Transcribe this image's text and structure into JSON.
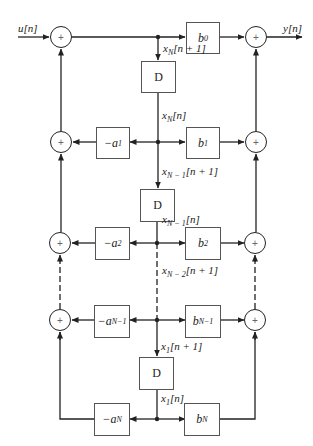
{
  "diagram": {
    "type": "signal-flow block diagram (direct form II transposed / state-space)",
    "input_label": "u[n]",
    "output_label": "y[n]",
    "adder_symbol": "+",
    "delay_label": "D",
    "feedforward_gains": [
      {
        "base": "b",
        "sub": "0"
      },
      {
        "base": "b",
        "sub": "1"
      },
      {
        "base": "b",
        "sub": "2"
      },
      {
        "base": "b",
        "sub": "N−1"
      },
      {
        "base": "b",
        "sub": "N"
      }
    ],
    "feedback_gains": [
      {
        "prefix": "−",
        "base": "a",
        "sub": "1"
      },
      {
        "prefix": "−",
        "base": "a",
        "sub": "2"
      },
      {
        "prefix": "−",
        "base": "a",
        "sub": "N−1"
      },
      {
        "prefix": "−",
        "base": "a",
        "sub": "N"
      }
    ],
    "state_labels": [
      {
        "base": "x",
        "sub": "N",
        "arg": "[n + 1]"
      },
      {
        "base": "x",
        "sub": "N",
        "arg": "[n]"
      },
      {
        "base": "x",
        "sub": "N − 1",
        "arg": "[n + 1]"
      },
      {
        "base": "x",
        "sub": "N − 1",
        "arg": "[n]"
      },
      {
        "base": "x",
        "sub": "N − 2",
        "arg": "[n + 1]"
      },
      {
        "base": "x",
        "sub": "1",
        "arg": "[n + 1]"
      },
      {
        "base": "x",
        "sub": "1",
        "arg": "[n]"
      }
    ],
    "colors": {
      "line": "#222222",
      "box_border": "#555555",
      "background": "#ffffff"
    }
  }
}
